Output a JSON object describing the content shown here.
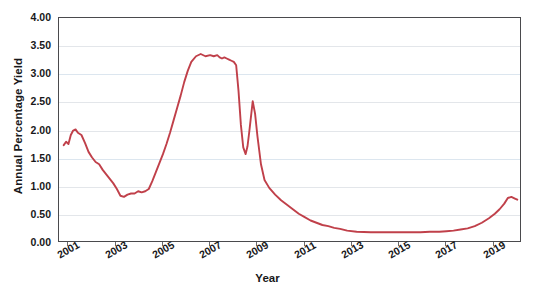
{
  "caption_strip": "",
  "chart_data": {
    "type": "line",
    "title": "",
    "xlabel": "Year",
    "ylabel": "Annual Percentage Yield",
    "xlim": [
      2000.6,
      2020.2
    ],
    "ylim": [
      0.0,
      4.0
    ],
    "grid": true,
    "legend": null,
    "line_color": "#c0404a",
    "y_ticks": [
      "0.00",
      "0.50",
      "1.00",
      "1.50",
      "2.00",
      "2.50",
      "3.00",
      "3.50",
      "4.00"
    ],
    "y_tick_values": [
      0.0,
      0.5,
      1.0,
      1.5,
      2.0,
      2.5,
      3.0,
      3.5,
      4.0
    ],
    "x_ticks": [
      "2001",
      "2003",
      "2005",
      "2007",
      "2009",
      "2011",
      "2013",
      "2015",
      "2017",
      "2019"
    ],
    "x_tick_values": [
      2001,
      2003,
      2005,
      2007,
      2009,
      2011,
      2013,
      2015,
      2017,
      2019
    ],
    "series": [
      {
        "name": "Annual Percentage Yield",
        "x": [
          2000.8,
          2000.9,
          2001.0,
          2001.1,
          2001.2,
          2001.3,
          2001.4,
          2001.55,
          2001.7,
          2001.85,
          2002.0,
          2002.15,
          2002.3,
          2002.45,
          2002.6,
          2002.75,
          2002.9,
          2003.05,
          2003.2,
          2003.35,
          2003.5,
          2003.65,
          2003.8,
          2003.95,
          2004.1,
          2004.25,
          2004.4,
          2004.55,
          2004.7,
          2004.85,
          2005.0,
          2005.15,
          2005.3,
          2005.45,
          2005.6,
          2005.75,
          2005.9,
          2006.05,
          2006.2,
          2006.4,
          2006.6,
          2006.8,
          2007.0,
          2007.15,
          2007.3,
          2007.4,
          2007.5,
          2007.6,
          2007.7,
          2007.8,
          2007.9,
          2008.0,
          2008.1,
          2008.2,
          2008.3,
          2008.4,
          2008.5,
          2008.58,
          2008.65,
          2008.72,
          2008.8,
          2008.9,
          2009.0,
          2009.15,
          2009.3,
          2009.5,
          2009.75,
          2010.0,
          2010.25,
          2010.5,
          2010.75,
          2011.0,
          2011.25,
          2011.5,
          2011.75,
          2012.0,
          2012.25,
          2012.5,
          2012.8,
          2013.2,
          2013.8,
          2014.5,
          2015.2,
          2015.9,
          2016.3,
          2016.7,
          2017.0,
          2017.3,
          2017.6,
          2017.9,
          2018.2,
          2018.5,
          2018.8,
          2019.05,
          2019.25,
          2019.45,
          2019.6,
          2019.75,
          2019.9,
          2020.0
        ],
        "y": [
          1.74,
          1.8,
          1.76,
          1.92,
          2.0,
          2.02,
          1.96,
          1.92,
          1.78,
          1.62,
          1.52,
          1.44,
          1.4,
          1.3,
          1.22,
          1.14,
          1.06,
          0.96,
          0.84,
          0.82,
          0.86,
          0.88,
          0.88,
          0.92,
          0.9,
          0.92,
          0.96,
          1.1,
          1.26,
          1.42,
          1.58,
          1.76,
          1.96,
          2.18,
          2.4,
          2.62,
          2.86,
          3.06,
          3.22,
          3.32,
          3.36,
          3.32,
          3.34,
          3.32,
          3.34,
          3.3,
          3.28,
          3.3,
          3.28,
          3.26,
          3.24,
          3.22,
          3.16,
          2.7,
          2.1,
          1.7,
          1.58,
          1.72,
          1.96,
          2.22,
          2.52,
          2.3,
          1.9,
          1.4,
          1.12,
          0.98,
          0.86,
          0.76,
          0.68,
          0.6,
          0.52,
          0.46,
          0.4,
          0.36,
          0.32,
          0.3,
          0.27,
          0.25,
          0.22,
          0.2,
          0.19,
          0.19,
          0.19,
          0.19,
          0.2,
          0.2,
          0.21,
          0.22,
          0.24,
          0.26,
          0.3,
          0.36,
          0.44,
          0.52,
          0.6,
          0.7,
          0.8,
          0.82,
          0.79,
          0.77
        ]
      }
    ]
  }
}
